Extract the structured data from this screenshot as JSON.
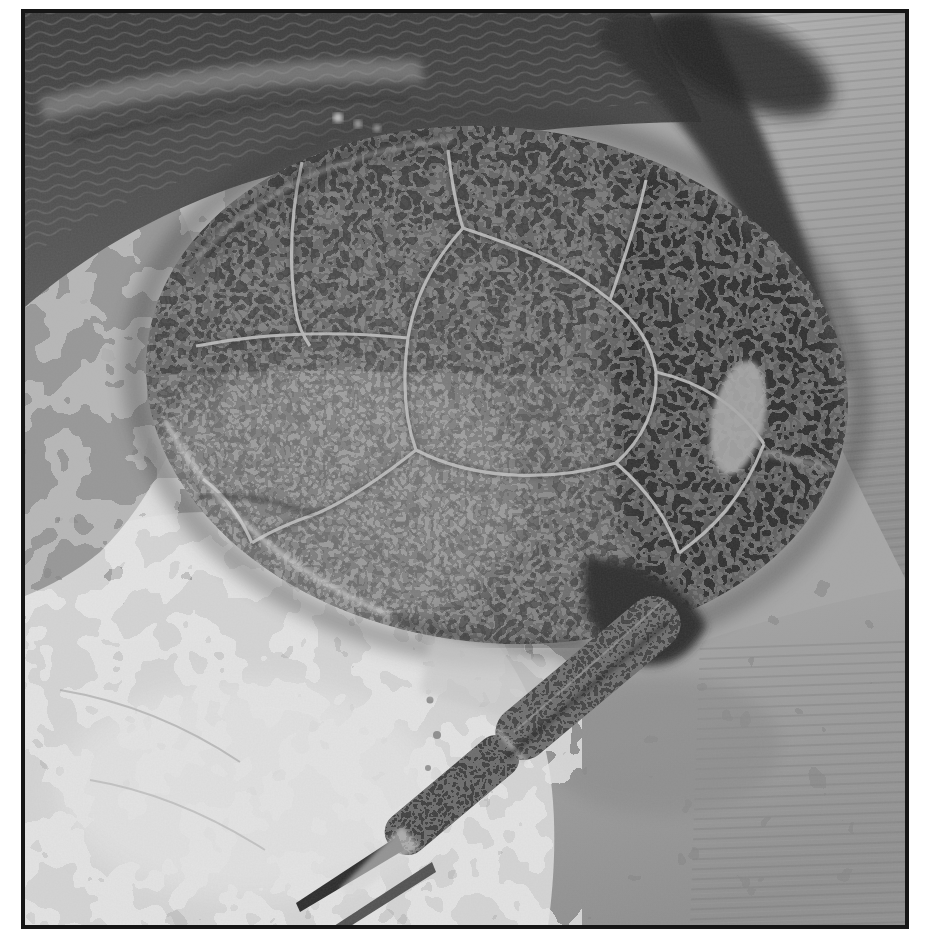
{
  "figure": {
    "alt": "Black-and-white photograph of a fossil armored fish viewed from above: an oval bony head-and-trunk shield composed of polygonal plates covered with worm-like vermiculate tubercle ornament, embedded in pale rock matrix; a segmented arm-like pectoral appendage extends from the lower right of the shield toward the bottom left, ending in thin pointed spines; the photograph has a thin black frame on a white page.",
    "photo_kind": "monochrome halftone plate photograph",
    "frame": {
      "border_color": "#161616",
      "page_color": "#ffffff"
    },
    "regions": {
      "rock_matrix_top": "dark rippled rock surface band across the top",
      "rock_matrix_top_right": "pale matrix with fine diagonal preparation scratches",
      "rock_matrix_left": "mid-grey rough matrix column",
      "rock_matrix_bottom_left": "very pale mottled matrix",
      "rock_matrix_bottom_right": "mid-grey rough matrix with horizontal striations",
      "shield": "large oval dorsal shield of polygonal plates with vermiculate ornament",
      "shield_posterior": "darker posterior plates with a small pale damaged patch",
      "sutures": "pale ridge-like suture lines separating the plates",
      "shadow_step": "horizontal tonal step crossing the shield, darker above",
      "appendage": "jointed pectoral appendage of two dark textured segments with thin pointed distal spines"
    },
    "palette": {
      "matrix_light": "#d6d6d6",
      "matrix_mid": "#9c9c9c",
      "matrix_dark": "#3f3f3f",
      "shield_base": "#565656",
      "shield_dark": "#2b2b2b",
      "ornament_light": "#aeaeae",
      "suture_light": "#c6c6c6"
    }
  }
}
